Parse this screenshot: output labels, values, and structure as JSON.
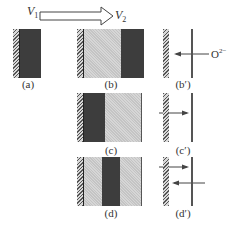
{
  "diagram": {
    "top_arrow": {
      "from_label": "V",
      "from_sub": "1",
      "to_label": "V",
      "to_sub": "2"
    },
    "panels": [
      {
        "id": "a",
        "label": "(a)",
        "layers": [
          "hatch",
          "dark"
        ]
      },
      {
        "id": "b",
        "label": "(b)",
        "layers": [
          "hatch",
          "light",
          "dark"
        ]
      },
      {
        "id": "c",
        "label": "(c)",
        "layers": [
          "hatch",
          "dark",
          "light"
        ]
      },
      {
        "id": "d",
        "label": "(d)",
        "layers": [
          "hatch",
          "light",
          "dark",
          "light"
        ]
      }
    ],
    "flux_panels": [
      {
        "id": "b_prime",
        "label": "(b′)",
        "arrows": [
          "left"
        ],
        "ion_label": "O",
        "ion_charge": "2−"
      },
      {
        "id": "c_prime",
        "label": "(c′)",
        "arrows": [
          "right"
        ]
      },
      {
        "id": "d_prime",
        "label": "(d′)",
        "arrows": [
          "right",
          "left"
        ]
      }
    ],
    "colors": {
      "dark_layer": "#3d3d3d",
      "light_layer": "#cfcfcf",
      "line": "#555555"
    }
  }
}
